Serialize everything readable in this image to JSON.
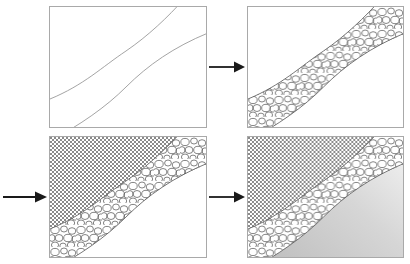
{
  "figure": {
    "panel_count": 4,
    "background_color": "#ffffff",
    "frame_color": "#a9a9a9"
  },
  "panels": [
    {
      "id": "panel-1",
      "step": "1",
      "position": "top-left",
      "caption": "Outline curves only",
      "description": "Two parallel S-shaped curves drawn on a blank white rectangle, defining an inclined band running from lower-left to upper-right.",
      "fills": {
        "above_band": "none",
        "band": "none",
        "below_band": "none"
      },
      "line_color": "#888888"
    },
    {
      "id": "panel-2",
      "step": "2",
      "position": "top-right",
      "caption": "Conglomerate band filled",
      "description": "The band between the two curves is filled with a rounded pebble (conglomerate) pattern; areas above and below remain white.",
      "fills": {
        "above_band": "none",
        "band": "pebble-conglomerate",
        "below_band": "none"
      },
      "line_color": "#666666"
    },
    {
      "id": "panel-3",
      "step": "3",
      "position": "bottom-left",
      "caption": "Cross-hatch unit added above",
      "description": "A fine checkerboard cross-hatch pattern fills the region above the conglomerate band; region below remains white.",
      "fills": {
        "above_band": "checker-crosshatch",
        "band": "pebble-conglomerate",
        "below_band": "none"
      },
      "line_color": "#666666"
    },
    {
      "id": "panel-4",
      "step": "4",
      "position": "bottom-right",
      "caption": "Gradient unit added below",
      "description": "A smooth light-grey gradient fills the region below the conglomerate band, lightest toward the upper right; the cross-hatch unit remains above.",
      "fills": {
        "above_band": "checker-crosshatch",
        "band": "pebble-conglomerate",
        "below_band": "grey-gradient"
      },
      "line_color": "#666666"
    }
  ],
  "arrows": [
    {
      "id": "arrow-1",
      "label": "step 1 to step 2",
      "direction": "right",
      "from_panel": "panel-1",
      "to_panel": "panel-2"
    },
    {
      "id": "arrow-2",
      "label": "step 2 to step 3",
      "direction": "right",
      "from_panel": "panel-2",
      "to_panel": "panel-3"
    },
    {
      "id": "arrow-3",
      "label": "step 3 to step 4",
      "direction": "right",
      "from_panel": "panel-3",
      "to_panel": "panel-4"
    }
  ],
  "patterns": {
    "pebble_conglomerate": {
      "name": "pebble-conglomerate",
      "fill_color": "#ffffff",
      "stroke_color": "#555555"
    },
    "checker_crosshatch": {
      "name": "checker-crosshatch",
      "light_color": "#ffffff",
      "dark_color": "#808080",
      "cell_size_px": "2"
    },
    "grey_gradient": {
      "name": "grey-gradient",
      "light_color": "#f7f7f7",
      "dark_color": "#bdbdbd"
    }
  },
  "colors": {
    "arrow": "#1a1a1a",
    "frame": "#a9a9a9",
    "outline_light": "#888888",
    "outline_dark": "#555555"
  }
}
